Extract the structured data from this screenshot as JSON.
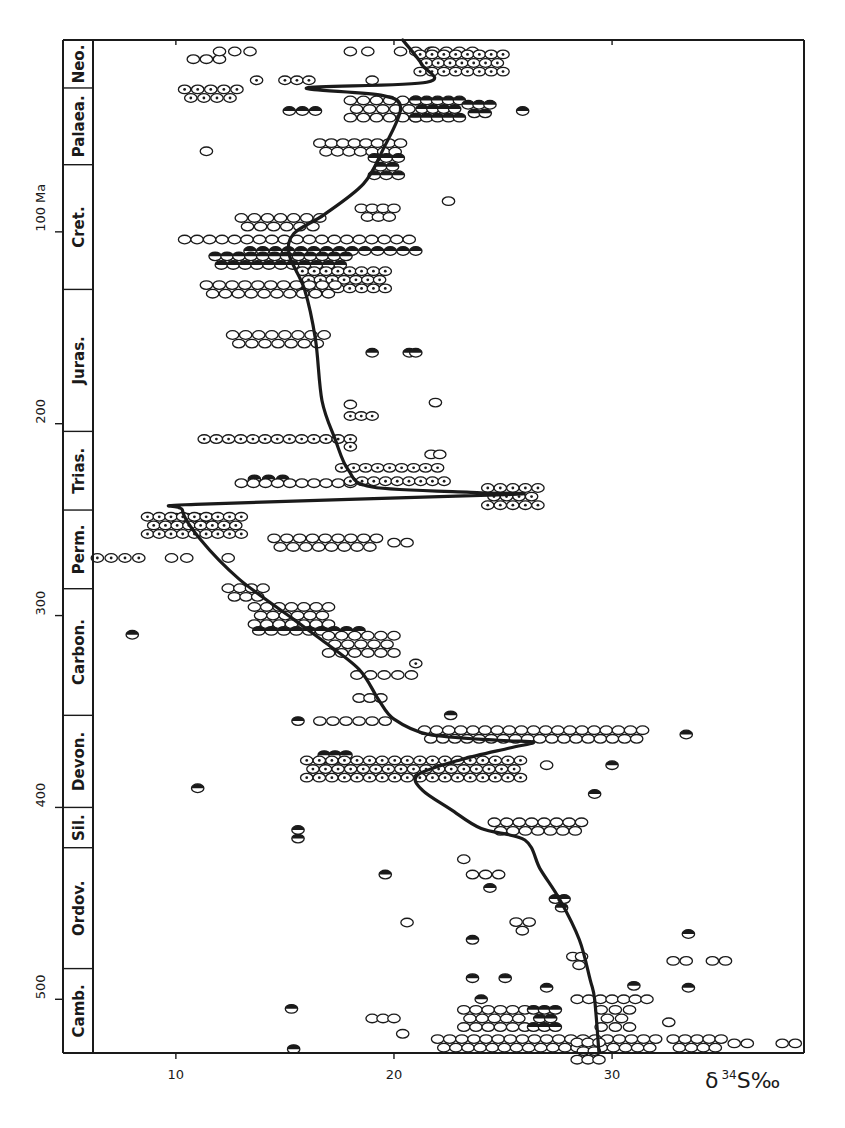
{
  "chart_data": {
    "type": "scatter",
    "title": "",
    "xlabel": "δ34S‰",
    "xlabel_parts": {
      "delta": "δ",
      "isotope": "34",
      "element": "S",
      "unit": "‰"
    },
    "ylabel": "Ma",
    "y_unit_label": "100 Ma",
    "xlim": [
      6.2,
      38.8
    ],
    "ylim": [
      0,
      528
    ],
    "y_inverted": false,
    "x_ticks": [
      10,
      20,
      30
    ],
    "x_tick_labels": [
      "10",
      "20",
      "30"
    ],
    "y_ticks": [
      100,
      200,
      300,
      400,
      500
    ],
    "y_tick_labels": [
      "100 Ma",
      "200",
      "300",
      "400",
      "500"
    ],
    "grid": false,
    "legend": "none",
    "periods": [
      {
        "name": "Neo.",
        "from": 0,
        "to": 25
      },
      {
        "name": "Palaea.",
        "from": 25,
        "to": 65
      },
      {
        "name": "Cret.",
        "from": 65,
        "to": 130
      },
      {
        "name": "Juras.",
        "from": 130,
        "to": 204
      },
      {
        "name": "Trias.",
        "from": 204,
        "to": 245
      },
      {
        "name": "Perm.",
        "from": 245,
        "to": 286
      },
      {
        "name": "Carbon.",
        "from": 286,
        "to": 352
      },
      {
        "name": "Devon.",
        "from": 352,
        "to": 400
      },
      {
        "name": "Sil.",
        "from": 400,
        "to": 421
      },
      {
        "name": "Ordov.",
        "from": 421,
        "to": 484
      },
      {
        "name": "Camb.",
        "from": 484,
        "to": 528
      }
    ],
    "series": [
      {
        "name": "age curve",
        "type": "line",
        "points": [
          [
            0,
            20.4
          ],
          [
            13,
            21.3
          ],
          [
            22,
            21.5
          ],
          [
            25,
            16.0
          ],
          [
            29,
            19.5
          ],
          [
            36,
            20.3
          ],
          [
            57,
            19.5
          ],
          [
            75,
            18.6
          ],
          [
            91,
            16.8
          ],
          [
            101,
            15.4
          ],
          [
            112,
            15.2
          ],
          [
            130,
            15.9
          ],
          [
            156,
            16.4
          ],
          [
            188,
            16.7
          ],
          [
            208,
            17.3
          ],
          [
            224,
            17.9
          ],
          [
            233,
            19.0
          ],
          [
            236,
            24.0
          ],
          [
            237,
            25.1
          ],
          [
            242,
            10.9
          ],
          [
            245,
            10.3
          ],
          [
            260,
            11.1
          ],
          [
            281,
            12.9
          ],
          [
            302,
            15.4
          ],
          [
            312,
            16.6
          ],
          [
            328,
            18.4
          ],
          [
            344,
            19.3
          ],
          [
            354,
            20.0
          ],
          [
            362,
            21.6
          ],
          [
            365,
            24.8
          ],
          [
            366,
            26.4
          ],
          [
            369,
            25.3
          ],
          [
            375,
            23.1
          ],
          [
            383,
            21.1
          ],
          [
            391,
            21.3
          ],
          [
            401,
            22.6
          ],
          [
            411,
            24.0
          ],
          [
            417,
            26.0
          ],
          [
            432,
            26.7
          ],
          [
            448,
            27.6
          ],
          [
            469,
            28.5
          ],
          [
            490,
            29.0
          ],
          [
            500,
            29.2
          ],
          [
            528,
            29.4
          ]
        ]
      },
      {
        "name": "samples",
        "type": "scatter",
        "marker_kinds": [
          "open",
          "dot",
          "half"
        ],
        "clusters": [
          {
            "age": 10,
            "x_from": 10.8,
            "x_to": 12.0,
            "rows": 1,
            "kind": "open"
          },
          {
            "age": 6,
            "x_from": 12.0,
            "x_to": 13.4,
            "rows": 1,
            "kind": "open"
          },
          {
            "age": 6,
            "x_from": 18.0,
            "x_to": 18.8,
            "rows": 1,
            "kind": "open"
          },
          {
            "age": 6,
            "x_from": 20.3,
            "x_to": 21.7,
            "rows": 1,
            "kind": "open"
          },
          {
            "age": 6,
            "x_from": 21.8,
            "x_to": 23.6,
            "rows": 1,
            "kind": "open"
          },
          {
            "age": 12,
            "x_from": 21.2,
            "x_to": 25.0,
            "rows": 3,
            "kind": "dot"
          },
          {
            "age": 21,
            "x_from": 13.7,
            "x_to": 13.7,
            "rows": 1,
            "kind": "dot"
          },
          {
            "age": 21,
            "x_from": 15.0,
            "x_to": 16.1,
            "rows": 1,
            "kind": "dot"
          },
          {
            "age": 21,
            "x_from": 19.0,
            "x_to": 19.0,
            "rows": 1,
            "kind": "open"
          },
          {
            "age": 28,
            "x_from": 10.4,
            "x_to": 12.8,
            "rows": 2,
            "kind": "dot"
          },
          {
            "age": 37,
            "x_from": 15.2,
            "x_to": 16.4,
            "rows": 1,
            "kind": "half"
          },
          {
            "age": 36,
            "x_from": 18.0,
            "x_to": 21.0,
            "rows": 3,
            "kind": "open"
          },
          {
            "age": 36,
            "x_from": 21.0,
            "x_to": 23.0,
            "rows": 3,
            "kind": "half"
          },
          {
            "age": 36,
            "x_from": 23.4,
            "x_to": 24.4,
            "rows": 2,
            "kind": "half"
          },
          {
            "age": 37,
            "x_from": 25.9,
            "x_to": 25.9,
            "rows": 1,
            "kind": "half"
          },
          {
            "age": 56,
            "x_from": 16.6,
            "x_to": 20.3,
            "rows": 2,
            "kind": "open"
          },
          {
            "age": 58,
            "x_from": 11.4,
            "x_to": 11.4,
            "rows": 1,
            "kind": "open"
          },
          {
            "age": 66,
            "x_from": 19.1,
            "x_to": 20.2,
            "rows": 3,
            "kind": "half"
          },
          {
            "age": 84,
            "x_from": 22.5,
            "x_to": 22.5,
            "rows": 1,
            "kind": "open"
          },
          {
            "age": 90,
            "x_from": 18.5,
            "x_to": 20.0,
            "rows": 2,
            "kind": "open"
          },
          {
            "age": 95,
            "x_from": 13.0,
            "x_to": 16.6,
            "rows": 2,
            "kind": "open"
          },
          {
            "age": 104,
            "x_from": 10.4,
            "x_to": 20.7,
            "rows": 1,
            "kind": "open"
          },
          {
            "age": 110,
            "x_from": 13.4,
            "x_to": 21.0,
            "rows": 1,
            "kind": "half"
          },
          {
            "age": 115,
            "x_from": 11.8,
            "x_to": 17.8,
            "rows": 2,
            "kind": "half"
          },
          {
            "age": 125,
            "x_from": 15.8,
            "x_to": 19.6,
            "rows": 3,
            "kind": "dot"
          },
          {
            "age": 130,
            "x_from": 11.4,
            "x_to": 17.3,
            "rows": 2,
            "kind": "open"
          },
          {
            "age": 156,
            "x_from": 12.6,
            "x_to": 16.8,
            "rows": 2,
            "kind": "open"
          },
          {
            "age": 163,
            "x_from": 19.0,
            "x_to": 19.0,
            "rows": 1,
            "kind": "half"
          },
          {
            "age": 163,
            "x_from": 20.7,
            "x_to": 21.0,
            "rows": 1,
            "kind": "half"
          },
          {
            "age": 190,
            "x_from": 18.0,
            "x_to": 18.0,
            "rows": 1,
            "kind": "open"
          },
          {
            "age": 189,
            "x_from": 21.9,
            "x_to": 21.9,
            "rows": 1,
            "kind": "open"
          },
          {
            "age": 196,
            "x_from": 18.0,
            "x_to": 19.0,
            "rows": 1,
            "kind": "dot"
          },
          {
            "age": 208,
            "x_from": 11.3,
            "x_to": 18.0,
            "rows": 1,
            "kind": "dot"
          },
          {
            "age": 212,
            "x_from": 18.0,
            "x_to": 18.0,
            "rows": 1,
            "kind": "dot"
          },
          {
            "age": 216,
            "x_from": 21.7,
            "x_to": 22.1,
            "rows": 1,
            "kind": "open"
          },
          {
            "age": 223,
            "x_from": 17.6,
            "x_to": 22.0,
            "rows": 1,
            "kind": "dot"
          },
          {
            "age": 229,
            "x_from": 13.6,
            "x_to": 14.9,
            "rows": 1,
            "kind": "half"
          },
          {
            "age": 231,
            "x_from": 13.0,
            "x_to": 18.0,
            "rows": 1,
            "kind": "open"
          },
          {
            "age": 230,
            "x_from": 18.0,
            "x_to": 22.3,
            "rows": 1,
            "kind": "dot"
          },
          {
            "age": 238,
            "x_from": 24.3,
            "x_to": 26.6,
            "rows": 3,
            "kind": "dot"
          },
          {
            "age": 249,
            "x_from": 10.0,
            "x_to": 11.5,
            "rows": 1,
            "kind": "dot"
          },
          {
            "age": 253,
            "x_from": 8.7,
            "x_to": 13.0,
            "rows": 3,
            "kind": "dot"
          },
          {
            "age": 262,
            "x_from": 14.5,
            "x_to": 19.2,
            "rows": 2,
            "kind": "open"
          },
          {
            "age": 262,
            "x_from": 20.0,
            "x_to": 20.6,
            "rows": 1,
            "kind": "open"
          },
          {
            "age": 270,
            "x_from": 6.4,
            "x_to": 8.3,
            "rows": 1,
            "kind": "dot"
          },
          {
            "age": 270,
            "x_from": 9.8,
            "x_to": 10.5,
            "rows": 1,
            "kind": "open"
          },
          {
            "age": 270,
            "x_from": 12.4,
            "x_to": 12.4,
            "rows": 1,
            "kind": "open"
          },
          {
            "age": 288,
            "x_from": 12.4,
            "x_to": 14.0,
            "rows": 2,
            "kind": "open"
          },
          {
            "age": 300,
            "x_from": 13.6,
            "x_to": 17.0,
            "rows": 3,
            "kind": "open"
          },
          {
            "age": 308,
            "x_from": 13.8,
            "x_to": 18.4,
            "rows": 1,
            "kind": "half"
          },
          {
            "age": 310,
            "x_from": 8.0,
            "x_to": 8.0,
            "rows": 1,
            "kind": "half"
          },
          {
            "age": 315,
            "x_from": 17.0,
            "x_to": 20.0,
            "rows": 3,
            "kind": "open"
          },
          {
            "age": 325,
            "x_from": 21.0,
            "x_to": 21.0,
            "rows": 1,
            "kind": "dot"
          },
          {
            "age": 331,
            "x_from": 18.3,
            "x_to": 20.8,
            "rows": 1,
            "kind": "open"
          },
          {
            "age": 343,
            "x_from": 18.4,
            "x_to": 19.4,
            "rows": 1,
            "kind": "open"
          },
          {
            "age": 355,
            "x_from": 15.6,
            "x_to": 15.6,
            "rows": 1,
            "kind": "half"
          },
          {
            "age": 355,
            "x_from": 16.6,
            "x_to": 19.6,
            "rows": 1,
            "kind": "open"
          },
          {
            "age": 352,
            "x_from": 22.6,
            "x_to": 22.6,
            "rows": 1,
            "kind": "half"
          },
          {
            "age": 362,
            "x_from": 21.4,
            "x_to": 31.4,
            "rows": 2,
            "kind": "open"
          },
          {
            "age": 362,
            "x_from": 33.4,
            "x_to": 33.4,
            "rows": 1,
            "kind": "half"
          },
          {
            "age": 375,
            "x_from": 16.8,
            "x_to": 17.8,
            "rows": 2,
            "kind": "half"
          },
          {
            "age": 380,
            "x_from": 16.0,
            "x_to": 25.8,
            "rows": 3,
            "kind": "dot"
          },
          {
            "age": 378,
            "x_from": 27.0,
            "x_to": 27.0,
            "rows": 1,
            "kind": "open"
          },
          {
            "age": 378,
            "x_from": 30.0,
            "x_to": 30.0,
            "rows": 1,
            "kind": "half"
          },
          {
            "age": 390,
            "x_from": 11.0,
            "x_to": 11.0,
            "rows": 1,
            "kind": "half"
          },
          {
            "age": 393,
            "x_from": 29.2,
            "x_to": 29.2,
            "rows": 1,
            "kind": "half"
          },
          {
            "age": 410,
            "x_from": 24.6,
            "x_to": 28.6,
            "rows": 2,
            "kind": "open"
          },
          {
            "age": 414,
            "x_from": 15.6,
            "x_to": 15.6,
            "rows": 2,
            "kind": "half"
          },
          {
            "age": 427,
            "x_from": 23.2,
            "x_to": 23.2,
            "rows": 1,
            "kind": "open"
          },
          {
            "age": 435,
            "x_from": 19.6,
            "x_to": 19.6,
            "rows": 1,
            "kind": "half"
          },
          {
            "age": 435,
            "x_from": 23.6,
            "x_to": 24.8,
            "rows": 1,
            "kind": "open"
          },
          {
            "age": 442,
            "x_from": 24.4,
            "x_to": 24.4,
            "rows": 1,
            "kind": "half"
          },
          {
            "age": 450,
            "x_from": 27.4,
            "x_to": 27.8,
            "rows": 2,
            "kind": "half"
          },
          {
            "age": 460,
            "x_from": 20.6,
            "x_to": 20.6,
            "rows": 1,
            "kind": "open"
          },
          {
            "age": 462,
            "x_from": 25.6,
            "x_to": 26.2,
            "rows": 2,
            "kind": "open"
          },
          {
            "age": 469,
            "x_from": 23.6,
            "x_to": 23.6,
            "rows": 1,
            "kind": "half"
          },
          {
            "age": 466,
            "x_from": 33.5,
            "x_to": 33.5,
            "rows": 1,
            "kind": "half"
          },
          {
            "age": 480,
            "x_from": 28.2,
            "x_to": 28.6,
            "rows": 2,
            "kind": "open"
          },
          {
            "age": 480,
            "x_from": 32.8,
            "x_to": 33.4,
            "rows": 1,
            "kind": "open"
          },
          {
            "age": 480,
            "x_from": 34.6,
            "x_to": 35.2,
            "rows": 1,
            "kind": "open"
          },
          {
            "age": 489,
            "x_from": 23.6,
            "x_to": 23.6,
            "rows": 1,
            "kind": "half"
          },
          {
            "age": 489,
            "x_from": 25.1,
            "x_to": 25.1,
            "rows": 1,
            "kind": "half"
          },
          {
            "age": 494,
            "x_from": 27.0,
            "x_to": 27.0,
            "rows": 1,
            "kind": "half"
          },
          {
            "age": 494,
            "x_from": 33.5,
            "x_to": 33.5,
            "rows": 1,
            "kind": "half"
          },
          {
            "age": 493,
            "x_from": 31.0,
            "x_to": 31.0,
            "rows": 1,
            "kind": "half"
          },
          {
            "age": 500,
            "x_from": 28.4,
            "x_to": 31.6,
            "rows": 1,
            "kind": "open"
          },
          {
            "age": 500,
            "x_from": 24.0,
            "x_to": 24.0,
            "rows": 1,
            "kind": "half"
          },
          {
            "age": 505,
            "x_from": 15.3,
            "x_to": 15.3,
            "rows": 1,
            "kind": "half"
          },
          {
            "age": 510,
            "x_from": 19.0,
            "x_to": 20.0,
            "rows": 1,
            "kind": "open"
          },
          {
            "age": 510,
            "x_from": 23.2,
            "x_to": 26.0,
            "rows": 3,
            "kind": "open"
          },
          {
            "age": 510,
            "x_from": 26.4,
            "x_to": 27.4,
            "rows": 3,
            "kind": "half"
          },
          {
            "age": 510,
            "x_from": 29.5,
            "x_to": 30.8,
            "rows": 3,
            "kind": "open"
          },
          {
            "age": 512,
            "x_from": 32.6,
            "x_to": 32.6,
            "rows": 1,
            "kind": "open"
          },
          {
            "age": 518,
            "x_from": 20.4,
            "x_to": 20.4,
            "rows": 1,
            "kind": "open"
          },
          {
            "age": 523,
            "x_from": 22.0,
            "x_to": 32.0,
            "rows": 2,
            "kind": "open"
          },
          {
            "age": 523,
            "x_from": 32.8,
            "x_to": 35.0,
            "rows": 2,
            "kind": "open"
          },
          {
            "age": 523,
            "x_from": 35.6,
            "x_to": 36.2,
            "rows": 1,
            "kind": "open"
          },
          {
            "age": 523,
            "x_from": 37.8,
            "x_to": 38.4,
            "rows": 1,
            "kind": "open"
          },
          {
            "age": 526,
            "x_from": 15.4,
            "x_to": 15.4,
            "rows": 1,
            "kind": "half"
          },
          {
            "age": 527,
            "x_from": 28.4,
            "x_to": 29.4,
            "rows": 3,
            "kind": "open"
          }
        ]
      }
    ]
  }
}
